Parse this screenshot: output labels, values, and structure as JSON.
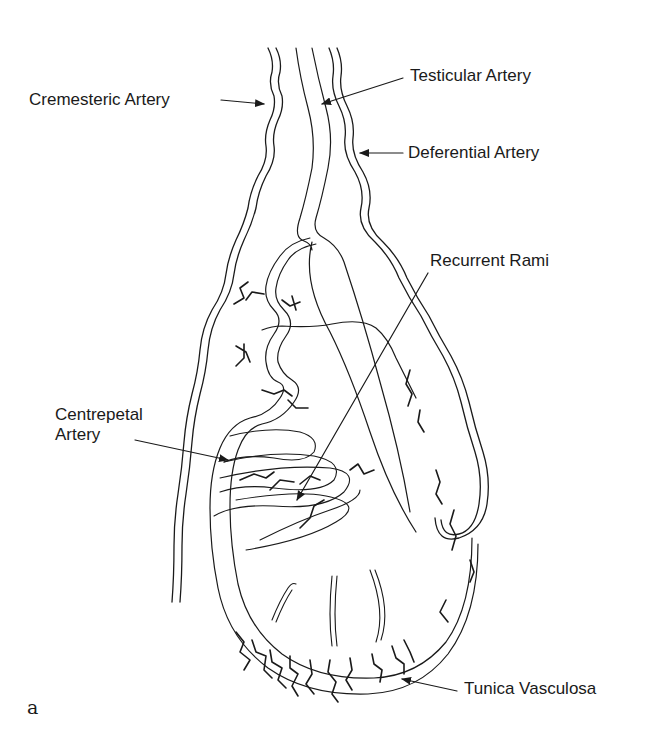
{
  "figure": {
    "panel_letter": "a",
    "labels": {
      "cremesteric": "Cremesteric Artery",
      "testicular": "Testicular Artery",
      "deferential": "Deferential Artery",
      "recurrent": "Recurrent Rami",
      "centrepetal_line1": "Centrepetal",
      "centrepetal_line2": "Artery",
      "tunica": "Tunica Vasculosa"
    },
    "colors": {
      "ink": "#1a1a1a",
      "background": "#ffffff"
    }
  }
}
